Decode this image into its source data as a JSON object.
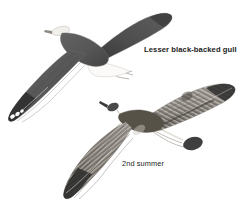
{
  "plate": {
    "name": "lesser-black-backed-gull-flight-plate",
    "background_color": "#ffffff",
    "width": 251,
    "height": 217
  },
  "labels": {
    "species": "Lesser black-backed gull",
    "age": "2nd summer"
  },
  "palette": {
    "background": "#ffffff",
    "upperwing_dark": "#5a5a5a",
    "upperwing_dark_shade": "#4a4a4a",
    "flight_feather_black": "#333333",
    "mantle_dark": "#575757",
    "immature_brown": "#8e8a84",
    "immature_barring": "#6e6a64",
    "pale_fringe": "#d8d4cd",
    "white_mirror": "#ffffff",
    "outline": "#6b6b6b",
    "text": "#1a1a1a"
  },
  "figures": [
    {
      "id": "adult-gull",
      "name": "adult-lesser-black-backed-gull",
      "age_class": "adult",
      "pose": "flight-upperside",
      "features": [
        "dark-slate-upperwings",
        "white-wingtip-mirrors",
        "white-head",
        "white-tail",
        "yellow-legs-trailing"
      ]
    },
    {
      "id": "second-summer-gull",
      "name": "second-summer-lesser-black-backed-gull",
      "age_class": "2nd summer",
      "pose": "flight-upperside",
      "features": [
        "barred-coverts",
        "dark-mantle-patch",
        "blackish-outer-primaries",
        "dark-tail-band",
        "mottled-inner-wing"
      ]
    }
  ]
}
